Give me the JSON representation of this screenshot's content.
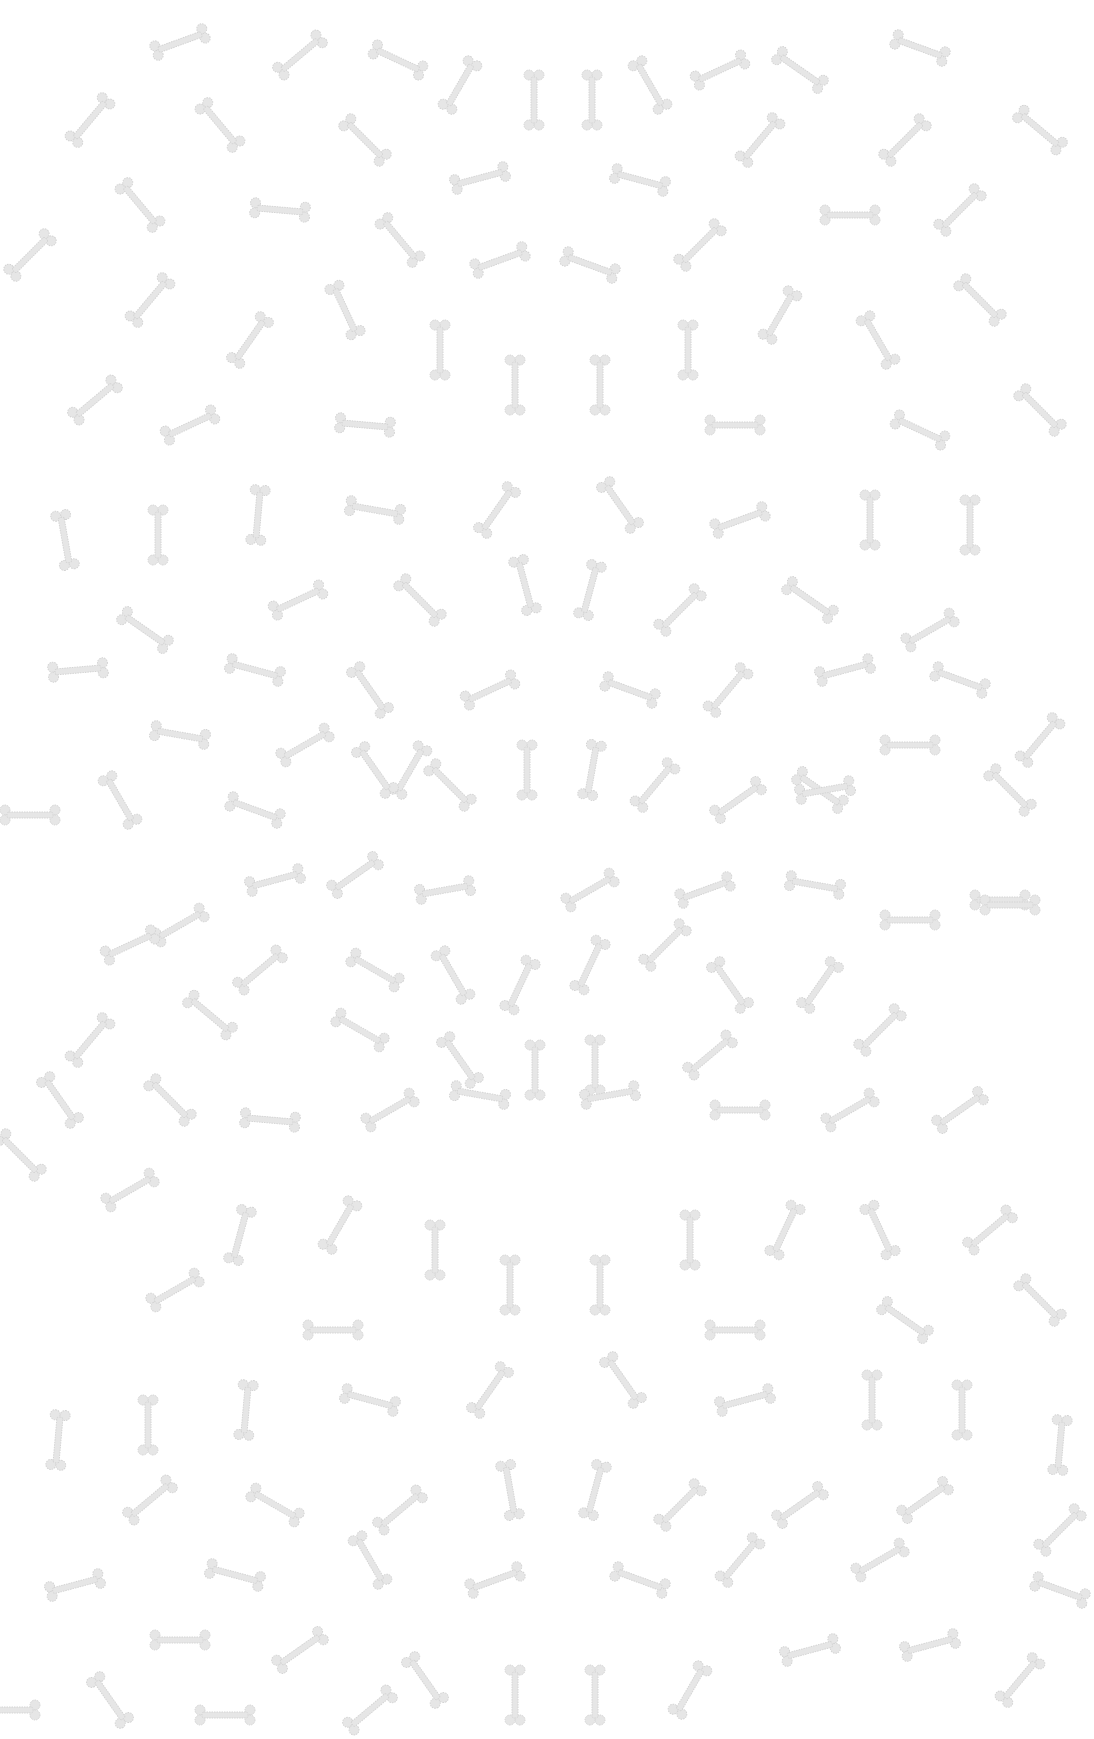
{
  "pattern": {
    "name": "bone-pattern",
    "background": "#ffffff",
    "bone_color": "#e6e6e6",
    "bone_outline": "#d4d4d4",
    "bones": [
      [
        180,
        42,
        -20
      ],
      [
        300,
        55,
        -40
      ],
      [
        398,
        60,
        25
      ],
      [
        460,
        85,
        -60
      ],
      [
        534,
        100,
        90
      ],
      [
        592,
        100,
        90
      ],
      [
        650,
        85,
        60
      ],
      [
        720,
        70,
        -25
      ],
      [
        800,
        70,
        35
      ],
      [
        920,
        48,
        20
      ],
      [
        90,
        120,
        -50
      ],
      [
        220,
        125,
        50
      ],
      [
        365,
        140,
        45
      ],
      [
        1040,
        130,
        40
      ],
      [
        480,
        178,
        -15
      ],
      [
        640,
        180,
        15
      ],
      [
        760,
        140,
        -50
      ],
      [
        905,
        140,
        -45
      ],
      [
        140,
        205,
        50
      ],
      [
        280,
        210,
        5
      ],
      [
        400,
        240,
        50
      ],
      [
        30,
        255,
        -45
      ],
      [
        500,
        260,
        -20
      ],
      [
        590,
        265,
        20
      ],
      [
        700,
        245,
        -45
      ],
      [
        850,
        215,
        0
      ],
      [
        960,
        210,
        -45
      ],
      [
        150,
        300,
        -50
      ],
      [
        250,
        340,
        -55
      ],
      [
        345,
        310,
        65
      ],
      [
        440,
        350,
        90
      ],
      [
        515,
        385,
        90
      ],
      [
        600,
        385,
        90
      ],
      [
        688,
        350,
        90
      ],
      [
        780,
        315,
        -60
      ],
      [
        878,
        340,
        60
      ],
      [
        980,
        300,
        45
      ],
      [
        95,
        400,
        -40
      ],
      [
        190,
        425,
        -25
      ],
      [
        365,
        425,
        5
      ],
      [
        735,
        425,
        0
      ],
      [
        920,
        430,
        25
      ],
      [
        1040,
        410,
        45
      ],
      [
        65,
        540,
        80
      ],
      [
        158,
        535,
        90
      ],
      [
        258,
        515,
        -85
      ],
      [
        375,
        510,
        10
      ],
      [
        497,
        510,
        -55
      ],
      [
        620,
        505,
        55
      ],
      [
        740,
        520,
        -20
      ],
      [
        870,
        520,
        90
      ],
      [
        970,
        525,
        90
      ],
      [
        145,
        630,
        35
      ],
      [
        298,
        600,
        -25
      ],
      [
        420,
        600,
        45
      ],
      [
        525,
        585,
        75
      ],
      [
        590,
        590,
        -75
      ],
      [
        680,
        610,
        -45
      ],
      [
        810,
        600,
        35
      ],
      [
        930,
        630,
        -30
      ],
      [
        78,
        670,
        -5
      ],
      [
        255,
        670,
        15
      ],
      [
        370,
        690,
        55
      ],
      [
        490,
        690,
        -25
      ],
      [
        630,
        690,
        20
      ],
      [
        728,
        690,
        -50
      ],
      [
        845,
        670,
        -15
      ],
      [
        960,
        680,
        20
      ],
      [
        180,
        735,
        10
      ],
      [
        305,
        745,
        -30
      ],
      [
        410,
        770,
        -60
      ],
      [
        820,
        790,
        35
      ],
      [
        910,
        745,
        0
      ],
      [
        1040,
        740,
        -50
      ],
      [
        120,
        800,
        60
      ],
      [
        255,
        810,
        20
      ],
      [
        375,
        770,
        55
      ],
      [
        450,
        785,
        45
      ],
      [
        527,
        770,
        90
      ],
      [
        592,
        770,
        -80
      ],
      [
        655,
        785,
        -50
      ],
      [
        738,
        800,
        -35
      ],
      [
        825,
        790,
        -10
      ],
      [
        1010,
        790,
        45
      ],
      [
        30,
        815,
        0
      ],
      [
        180,
        925,
        -30
      ],
      [
        275,
        880,
        -15
      ],
      [
        355,
        875,
        -35
      ],
      [
        445,
        890,
        -10
      ],
      [
        590,
        890,
        -30
      ],
      [
        705,
        890,
        -20
      ],
      [
        815,
        885,
        10
      ],
      [
        910,
        920,
        0
      ],
      [
        1000,
        900,
        0
      ],
      [
        130,
        945,
        -25
      ],
      [
        260,
        970,
        -40
      ],
      [
        375,
        970,
        30
      ],
      [
        453,
        975,
        60
      ],
      [
        520,
        985,
        -65
      ],
      [
        590,
        965,
        -65
      ],
      [
        665,
        945,
        -45
      ],
      [
        730,
        985,
        55
      ],
      [
        820,
        985,
        -55
      ],
      [
        1010,
        905,
        0
      ],
      [
        90,
        1040,
        -50
      ],
      [
        210,
        1015,
        40
      ],
      [
        360,
        1030,
        30
      ],
      [
        460,
        1060,
        55
      ],
      [
        535,
        1070,
        90
      ],
      [
        595,
        1065,
        90
      ],
      [
        710,
        1055,
        -40
      ],
      [
        880,
        1030,
        -45
      ],
      [
        60,
        1100,
        55
      ],
      [
        170,
        1100,
        45
      ],
      [
        270,
        1120,
        5
      ],
      [
        390,
        1110,
        -30
      ],
      [
        480,
        1095,
        10
      ],
      [
        610,
        1095,
        -10
      ],
      [
        740,
        1110,
        0
      ],
      [
        850,
        1110,
        -30
      ],
      [
        960,
        1110,
        -35
      ],
      [
        20,
        1155,
        45
      ],
      [
        130,
        1190,
        -30
      ],
      [
        240,
        1235,
        -75
      ],
      [
        340,
        1225,
        -60
      ],
      [
        435,
        1250,
        90
      ],
      [
        510,
        1285,
        90
      ],
      [
        600,
        1285,
        90
      ],
      [
        690,
        1240,
        90
      ],
      [
        785,
        1230,
        -65
      ],
      [
        880,
        1230,
        65
      ],
      [
        990,
        1230,
        -40
      ],
      [
        175,
        1290,
        -30
      ],
      [
        333,
        1330,
        0
      ],
      [
        735,
        1330,
        0
      ],
      [
        905,
        1320,
        35
      ],
      [
        1040,
        1300,
        45
      ],
      [
        58,
        1440,
        -85
      ],
      [
        148,
        1425,
        90
      ],
      [
        246,
        1410,
        -85
      ],
      [
        370,
        1400,
        15
      ],
      [
        490,
        1390,
        -55
      ],
      [
        623,
        1380,
        55
      ],
      [
        745,
        1400,
        -15
      ],
      [
        872,
        1400,
        90
      ],
      [
        962,
        1410,
        90
      ],
      [
        1060,
        1445,
        -85
      ],
      [
        150,
        1500,
        -40
      ],
      [
        275,
        1505,
        30
      ],
      [
        400,
        1510,
        -40
      ],
      [
        510,
        1490,
        80
      ],
      [
        595,
        1490,
        -75
      ],
      [
        680,
        1505,
        -45
      ],
      [
        800,
        1505,
        -35
      ],
      [
        925,
        1500,
        -35
      ],
      [
        75,
        1585,
        -15
      ],
      [
        235,
        1575,
        15
      ],
      [
        370,
        1560,
        60
      ],
      [
        495,
        1580,
        -20
      ],
      [
        640,
        1580,
        20
      ],
      [
        740,
        1560,
        -50
      ],
      [
        880,
        1560,
        -30
      ],
      [
        1060,
        1590,
        20
      ],
      [
        180,
        1640,
        0
      ],
      [
        300,
        1650,
        -35
      ],
      [
        425,
        1680,
        55
      ],
      [
        515,
        1695,
        90
      ],
      [
        595,
        1695,
        90
      ],
      [
        690,
        1690,
        -60
      ],
      [
        810,
        1650,
        -15
      ],
      [
        930,
        1645,
        -15
      ],
      [
        1020,
        1680,
        -50
      ],
      [
        110,
        1700,
        55
      ],
      [
        225,
        1715,
        0
      ],
      [
        370,
        1710,
        -40
      ],
      [
        1060,
        1530,
        -45
      ],
      [
        10,
        1710,
        0
      ]
    ]
  }
}
